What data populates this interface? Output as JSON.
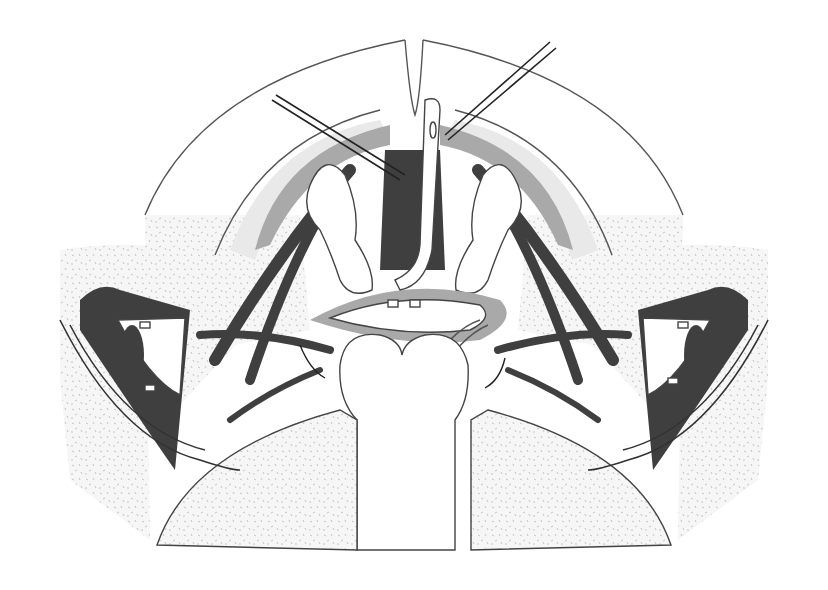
{
  "figure": {
    "colors": {
      "background": "#ffffff",
      "outline": "#444444",
      "light_tissue": "#e9e9e9",
      "mid_tissue": "#a9a9a9",
      "dark_tissue": "#3f3f3f"
    },
    "elements": {
      "outer_arc": "outer-arc",
      "inner_arc": "inner-arc",
      "catheter": "catheter",
      "sutures_left": "suture-threads-left",
      "sutures_right": "suture-threads-right",
      "retractor_left": "retractor-left",
      "retractor_right": "retractor-right",
      "central_organ": "heart-shaped-tissue",
      "thighs": [
        "thigh-left",
        "thigh-right"
      ]
    }
  }
}
